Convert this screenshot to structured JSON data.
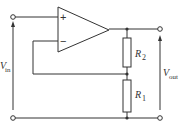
{
  "diagram": {
    "colors": {
      "wire": "#333333",
      "background": "#ffffff"
    },
    "opamp": {
      "plus_label": "+",
      "minus_label": "−"
    },
    "resistors": [
      {
        "id": "R2",
        "letter": "R",
        "subscript": "2"
      },
      {
        "id": "R1",
        "letter": "R",
        "subscript": "1"
      }
    ],
    "input": {
      "letter": "V",
      "subscript": "in"
    },
    "output": {
      "letter": "V",
      "subscript": "out"
    }
  }
}
